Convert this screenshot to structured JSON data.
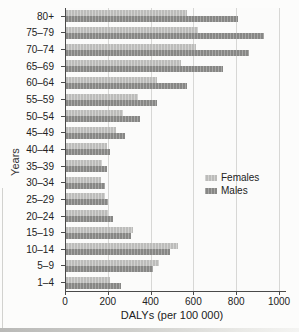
{
  "figure": {
    "background": "#fcfcfb"
  },
  "chart_data": {
    "type": "bar",
    "orientation": "horizontal",
    "title": "",
    "xlabel": "DALYs (per 100 000)",
    "ylabel": "Years",
    "xlim": [
      0,
      1000
    ],
    "x_ticks": [
      0,
      200,
      400,
      600,
      800,
      1000
    ],
    "grid": "vertical-gridlines-every-200",
    "legend_position": "inside-right",
    "categories": [
      "80+",
      "75–79",
      "70–74",
      "65–69",
      "60–64",
      "55–59",
      "50–54",
      "45–49",
      "40–44",
      "35–39",
      "30–34",
      "25–29",
      "20–24",
      "15–19",
      "10–14",
      "5–9",
      "1–4"
    ],
    "series": [
      {
        "name": "Females",
        "color": "#c6c6c4",
        "values": [
          570,
          620,
          610,
          540,
          430,
          340,
          270,
          240,
          195,
          175,
          170,
          185,
          200,
          320,
          530,
          440,
          210
        ]
      },
      {
        "name": "Males",
        "color": "#8e8e8c",
        "values": [
          810,
          930,
          860,
          740,
          570,
          430,
          350,
          280,
          210,
          195,
          185,
          200,
          225,
          310,
          490,
          410,
          260
        ]
      }
    ]
  },
  "legend": {
    "items": [
      {
        "label": "Females",
        "color": "#c6c6c4"
      },
      {
        "label": "Males",
        "color": "#8e8e8c"
      }
    ]
  },
  "colors": {
    "gridline": "#d7d7d5",
    "axis": "#4a4a4a",
    "text": "#222222"
  }
}
